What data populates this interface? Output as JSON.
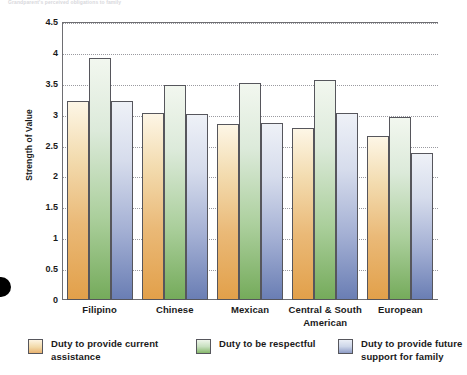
{
  "figure": {
    "caption_faint": "Grandparent's perceived obligations to family"
  },
  "axes": {
    "y_title": "Strength of Value",
    "y_ticks": [
      "4.5",
      "4",
      "3.5",
      "3",
      "2.5",
      "2",
      "1.5",
      "1",
      "0.5",
      "0"
    ]
  },
  "legend": {
    "items": [
      {
        "label": "Duty to provide current assistance",
        "color": "#e2a04a"
      },
      {
        "label": "Duty to be respectful",
        "color": "#75ab5b"
      },
      {
        "label": "Duty to provide future support for family",
        "color": "#6a7eb4"
      }
    ]
  },
  "chart_data": {
    "type": "bar",
    "title": "",
    "xlabel": "",
    "ylabel": "Strength of Value",
    "ylim": [
      0,
      4.5
    ],
    "ytick_step": 0.5,
    "grid": true,
    "legend_position": "bottom",
    "categories": [
      "Filipino",
      "Chinese",
      "Mexican",
      "Central & South American",
      "European"
    ],
    "series": [
      {
        "name": "Duty to provide current assistance",
        "color": "#e2a04a",
        "values": [
          3.22,
          3.03,
          2.85,
          2.78,
          2.65
        ]
      },
      {
        "name": "Duty to be respectful",
        "color": "#75ab5b",
        "values": [
          3.92,
          3.48,
          3.51,
          3.56,
          2.96
        ]
      },
      {
        "name": "Duty to provide future support for family",
        "color": "#6a7eb4",
        "values": [
          3.22,
          3.01,
          2.86,
          3.03,
          2.38
        ]
      }
    ]
  }
}
